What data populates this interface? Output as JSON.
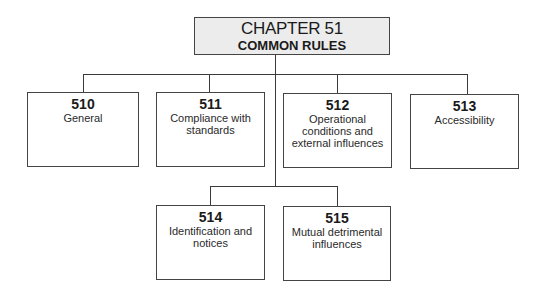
{
  "header": {
    "title": "CHAPTER 51",
    "subtitle": "COMMON RULES"
  },
  "top_row": [
    {
      "number": "510",
      "label": "General"
    },
    {
      "number": "511",
      "label": "Compliance with standards"
    },
    {
      "number": "512",
      "label": "Operational conditions and external influences"
    },
    {
      "number": "513",
      "label": "Accessibility"
    }
  ],
  "bottom_row": [
    {
      "number": "514",
      "label": "Identification and notices"
    },
    {
      "number": "515",
      "label": "Mutual detrimental influences"
    }
  ],
  "colors": {
    "title_fill": "#ececec",
    "line": "#3a3a3a",
    "box_fill": "#ffffff"
  }
}
